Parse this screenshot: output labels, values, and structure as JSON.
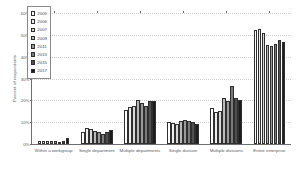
{
  "chart_data": {
    "type": "bar",
    "title": "",
    "xlabel": "",
    "ylabel": "Percent of respondents",
    "ylim": [
      0,
      60
    ],
    "ytick_labels": [
      "0%",
      "10%",
      "20%",
      "30%",
      "40%",
      "50%",
      "60%"
    ],
    "ytick_values": [
      0,
      10,
      20,
      30,
      40,
      50,
      60
    ],
    "grid": true,
    "legend_position": "upper-left-inside",
    "categories": [
      "Within a workgroup",
      "Single department",
      "Multiple departments",
      "Single division",
      "Multiple divisions",
      "Entire enterprise"
    ],
    "series": [
      {
        "name": "2005",
        "color": "#ffffff",
        "values": [
          1.5,
          5.5,
          15.5,
          10.0,
          16.5,
          52.0
        ]
      },
      {
        "name": "2006",
        "color": "#ededed",
        "values": [
          1.6,
          7.5,
          17.0,
          9.5,
          14.5,
          52.5
        ]
      },
      {
        "name": "2007",
        "color": "#d8d8d8",
        "values": [
          1.3,
          6.8,
          17.5,
          9.2,
          15.0,
          51.0
        ]
      },
      {
        "name": "2009",
        "color": "#b9b9b9",
        "values": [
          1.5,
          6.0,
          20.0,
          10.5,
          21.0,
          45.5
        ]
      },
      {
        "name": "2011",
        "color": "#9a9a9a",
        "values": [
          1.2,
          5.3,
          19.0,
          11.0,
          19.5,
          45.0
        ]
      },
      {
        "name": "2013",
        "color": "#7a7a7a",
        "values": [
          1.1,
          4.5,
          17.5,
          10.5,
          26.5,
          46.0
        ]
      },
      {
        "name": "2015",
        "color": "#4f4f4f",
        "values": [
          1.4,
          5.5,
          19.5,
          10.2,
          21.0,
          47.5
        ]
      },
      {
        "name": "2017",
        "color": "#1c1c1c",
        "values": [
          2.6,
          6.5,
          19.5,
          9.3,
          20.0,
          46.5
        ]
      }
    ]
  }
}
